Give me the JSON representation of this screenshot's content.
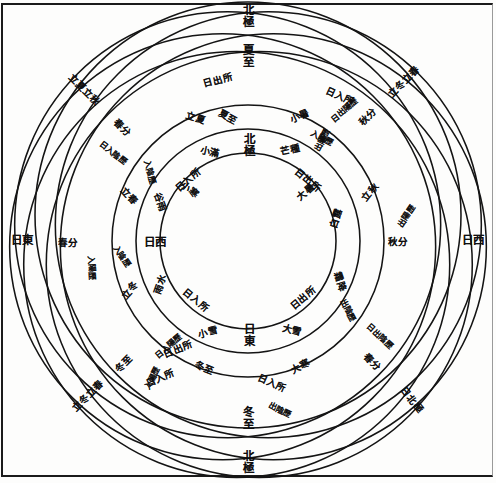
{
  "document": {
    "title": "七衡六間圖",
    "kind": "classical-chinese-astronomical-diagram"
  },
  "colors": {
    "ink": "#141414",
    "paper": "#fdfdfc",
    "frame": "#1b1b1b"
  },
  "chart_data": {
    "type": "diagram",
    "center": {
      "x": 248,
      "y": 241
    },
    "rings": [
      {
        "index": 1,
        "name": "內衡",
        "radius": 88,
        "cx": 248,
        "cy": 241
      },
      {
        "index": 2,
        "name": "二衡",
        "radius": 112,
        "cx": 248,
        "cy": 241
      },
      {
        "index": 3,
        "name": "三衡",
        "radius": 136,
        "cx": 248,
        "cy": 241
      },
      {
        "index": 4,
        "name": "中衡",
        "radius": 160,
        "cx": 248,
        "cy": 241
      },
      {
        "index": 5,
        "name": "五衡",
        "radius": 184,
        "cx": 248,
        "cy": 241
      },
      {
        "index": 6,
        "name": "六衡",
        "radius": 207,
        "cx": 248,
        "cy": 241
      },
      {
        "index": 7,
        "name": "外衡",
        "radius": 213,
        "cx": 248,
        "cy": 241
      }
    ],
    "offset_family": {
      "count": 7,
      "note": "each heng circle is drawn offset from the plate centre so the family interlaces",
      "offset_radius": 26,
      "start_angle_deg": -90
    }
  },
  "labels": {
    "cardinal": [
      {
        "id": "top-outer",
        "text": "北極",
        "x": 247,
        "y": 16,
        "size": "sz-md",
        "rot": 0,
        "orient": "vert"
      },
      {
        "id": "top-inner",
        "text": "夏至",
        "x": 247,
        "y": 56,
        "size": "sz-md",
        "rot": 0,
        "orient": "vert"
      },
      {
        "id": "bottom-inner",
        "text": "冬至",
        "x": 247,
        "y": 418,
        "size": "sz-md",
        "rot": 0,
        "orient": "vert"
      },
      {
        "id": "bottom-outer",
        "text": "北極",
        "x": 247,
        "y": 462,
        "size": "sz-md",
        "rot": 0,
        "orient": "vert"
      },
      {
        "id": "left-outer",
        "text": "日東",
        "x": 22,
        "y": 241,
        "size": "sz-md",
        "rot": 0,
        "orient": "horiz"
      },
      {
        "id": "right-outer",
        "text": "日西",
        "x": 473,
        "y": 241,
        "size": "sz-md",
        "rot": 0,
        "orient": "horiz"
      }
    ],
    "inner_ring": [
      {
        "id": "in-top",
        "text": "北極",
        "x": 248,
        "y": 145,
        "size": "sz-md",
        "rot": 0,
        "orient": "vert"
      },
      {
        "id": "in-left",
        "text": "日西",
        "x": 155,
        "y": 243,
        "size": "sz-md",
        "rot": 0,
        "orient": "horiz"
      },
      {
        "id": "in-bottom",
        "text": "日東",
        "x": 248,
        "y": 335,
        "size": "sz-md",
        "rot": 0,
        "orient": "vert"
      },
      {
        "id": "in-ul",
        "text": "日入所",
        "x": 188,
        "y": 180,
        "size": "sz-sm",
        "rot": -40,
        "orient": "horiz"
      },
      {
        "id": "in-ur",
        "text": "日出所",
        "x": 308,
        "y": 180,
        "size": "sz-sm",
        "rot": 40,
        "orient": "horiz"
      },
      {
        "id": "in-ll",
        "text": "日入所",
        "x": 196,
        "y": 300,
        "size": "sz-sm",
        "rot": 40,
        "orient": "horiz"
      },
      {
        "id": "in-lr",
        "text": "日出所",
        "x": 303,
        "y": 298,
        "size": "sz-sm",
        "rot": -40,
        "orient": "horiz"
      }
    ],
    "solar_terms": [
      {
        "id": "st-ul-1",
        "text": "立夏立秋",
        "x": 84,
        "y": 90,
        "size": "sz-sm",
        "rot": 45,
        "orient": "horiz"
      },
      {
        "id": "st-ul-2",
        "text": "春分",
        "x": 122,
        "y": 128,
        "size": "sz-sm",
        "rot": 45,
        "orient": "horiz"
      },
      {
        "id": "st-ul-3",
        "text": "日入陰歷",
        "x": 113,
        "y": 153,
        "size": "sz-xs",
        "rot": 38,
        "orient": "horiz"
      },
      {
        "id": "st-ul-4",
        "text": "入陰歷",
        "x": 150,
        "y": 172,
        "size": "sz-xs",
        "rot": 72,
        "orient": "horiz"
      },
      {
        "id": "st-ul-5",
        "text": "立春",
        "x": 129,
        "y": 196,
        "size": "sz-sm",
        "rot": 48,
        "orient": "horiz"
      },
      {
        "id": "st-ur-1",
        "text": "立冬立春",
        "x": 404,
        "y": 82,
        "size": "sz-sm",
        "rot": -45,
        "orient": "horiz"
      },
      {
        "id": "st-ur-2",
        "text": "秋分",
        "x": 368,
        "y": 117,
        "size": "sz-sm",
        "rot": -45,
        "orient": "horiz"
      },
      {
        "id": "st-ur-3",
        "text": "日出陽歷",
        "x": 344,
        "y": 110,
        "size": "sz-xs",
        "rot": -40,
        "orient": "horiz"
      },
      {
        "id": "st-ur-4",
        "text": "出陽歷",
        "x": 322,
        "y": 140,
        "size": "sz-xs",
        "rot": -62,
        "orient": "horiz"
      },
      {
        "id": "st-ur-5",
        "text": "立秋",
        "x": 370,
        "y": 192,
        "size": "sz-sm",
        "rot": -52,
        "orient": "horiz"
      },
      {
        "id": "st-ll-1",
        "text": "立冬立春",
        "x": 88,
        "y": 396,
        "size": "sz-sm",
        "rot": -45,
        "orient": "horiz"
      },
      {
        "id": "st-ll-2",
        "text": "冬至",
        "x": 124,
        "y": 364,
        "size": "sz-sm",
        "rot": -45,
        "orient": "horiz"
      },
      {
        "id": "st-ll-3",
        "text": "入陽歷",
        "x": 152,
        "y": 378,
        "size": "sz-xs",
        "rot": -62,
        "orient": "horiz"
      },
      {
        "id": "st-ll-4",
        "text": "日入陽歷",
        "x": 168,
        "y": 346,
        "size": "sz-xs",
        "rot": -40,
        "orient": "horiz"
      },
      {
        "id": "st-ll-5",
        "text": "立冬",
        "x": 130,
        "y": 290,
        "size": "sz-sm",
        "rot": -48,
        "orient": "horiz"
      },
      {
        "id": "st-lr-1",
        "text": "日北極",
        "x": 412,
        "y": 400,
        "size": "sz-sm",
        "rot": 52,
        "orient": "horiz"
      },
      {
        "id": "st-lr-2",
        "text": "春分",
        "x": 372,
        "y": 362,
        "size": "sz-sm",
        "rot": 48,
        "orient": "horiz"
      },
      {
        "id": "st-lr-3",
        "text": "日出陰歷",
        "x": 380,
        "y": 336,
        "size": "sz-xs",
        "rot": 42,
        "orient": "horiz"
      },
      {
        "id": "st-lr-4",
        "text": "出陰歷",
        "x": 348,
        "y": 310,
        "size": "sz-xs",
        "rot": 62,
        "orient": "horiz"
      },
      {
        "id": "st-lr-5",
        "text": "秋分",
        "x": 398,
        "y": 242,
        "size": "sz-sm",
        "rot": 0,
        "orient": "horiz"
      },
      {
        "id": "st-l-1",
        "text": "春分",
        "x": 68,
        "y": 243,
        "size": "sz-sm",
        "rot": 0,
        "orient": "horiz"
      },
      {
        "id": "st-l-2",
        "text": "入陽歷",
        "x": 92,
        "y": 268,
        "size": "sz-xs",
        "rot": 86,
        "orient": "horiz"
      },
      {
        "id": "st-l-3",
        "text": "入陰歷",
        "x": 122,
        "y": 256,
        "size": "sz-xs",
        "rot": 56,
        "orient": "horiz"
      },
      {
        "id": "st-r-1",
        "text": "出陽歷",
        "x": 406,
        "y": 216,
        "size": "sz-xs",
        "rot": -56,
        "orient": "horiz"
      },
      {
        "id": "st-t-1",
        "text": "日出所",
        "x": 218,
        "y": 80,
        "size": "sz-sm",
        "rot": -16,
        "orient": "horiz"
      },
      {
        "id": "st-t-2",
        "text": "日入所",
        "x": 340,
        "y": 96,
        "size": "sz-sm",
        "rot": 25,
        "orient": "horiz"
      },
      {
        "id": "st-t-3",
        "text": "立夏",
        "x": 196,
        "y": 118,
        "size": "sz-sm",
        "rot": 18,
        "orient": "horiz"
      },
      {
        "id": "st-t-4",
        "text": "夏至",
        "x": 228,
        "y": 117,
        "size": "sz-sm",
        "rot": 28,
        "orient": "horiz"
      },
      {
        "id": "st-t-5",
        "text": "小暑",
        "x": 300,
        "y": 116,
        "size": "sz-sm",
        "rot": -24,
        "orient": "horiz"
      },
      {
        "id": "st-t-6",
        "text": "入陰歷",
        "x": 322,
        "y": 138,
        "size": "sz-xs",
        "rot": 28,
        "orient": "horiz"
      },
      {
        "id": "st-b-1",
        "text": "日入所",
        "x": 272,
        "y": 383,
        "size": "sz-sm",
        "rot": 24,
        "orient": "horiz"
      },
      {
        "id": "st-b-2",
        "text": "日出所",
        "x": 178,
        "y": 349,
        "size": "sz-sm",
        "rot": -22,
        "orient": "horiz"
      },
      {
        "id": "st-b-3",
        "text": "日入所",
        "x": 160,
        "y": 378,
        "size": "sz-sm",
        "rot": -24,
        "orient": "horiz"
      },
      {
        "id": "st-b-4",
        "text": "冬至",
        "x": 204,
        "y": 368,
        "size": "sz-sm",
        "rot": 22,
        "orient": "horiz"
      },
      {
        "id": "st-b-5",
        "text": "大寒",
        "x": 300,
        "y": 366,
        "size": "sz-sm",
        "rot": -28,
        "orient": "horiz"
      },
      {
        "id": "st-b-6",
        "text": "出陰歷",
        "x": 280,
        "y": 410,
        "size": "sz-xs",
        "rot": 26,
        "orient": "horiz"
      },
      {
        "id": "st-m-1",
        "text": "小寒",
        "x": 190,
        "y": 190,
        "size": "sz-sm",
        "rot": 40,
        "orient": "horiz"
      },
      {
        "id": "st-m-2",
        "text": "大暑",
        "x": 306,
        "y": 192,
        "size": "sz-sm",
        "rot": -40,
        "orient": "horiz"
      },
      {
        "id": "st-m-3",
        "text": "白露",
        "x": 336,
        "y": 218,
        "size": "sz-sm",
        "rot": -72,
        "orient": "horiz"
      },
      {
        "id": "st-m-4",
        "text": "霜降",
        "x": 340,
        "y": 282,
        "size": "sz-sm",
        "rot": 72,
        "orient": "horiz"
      },
      {
        "id": "st-m-5",
        "text": "雨水",
        "x": 160,
        "y": 284,
        "size": "sz-sm",
        "rot": -70,
        "orient": "horiz"
      },
      {
        "id": "st-m-6",
        "text": "谷雨",
        "x": 160,
        "y": 202,
        "size": "sz-sm",
        "rot": 70,
        "orient": "horiz"
      },
      {
        "id": "st-m-7",
        "text": "小滿",
        "x": 210,
        "y": 152,
        "size": "sz-sm",
        "rot": 12,
        "orient": "horiz"
      },
      {
        "id": "st-m-8",
        "text": "芒種",
        "x": 290,
        "y": 150,
        "size": "sz-sm",
        "rot": -12,
        "orient": "horiz"
      },
      {
        "id": "st-m-9",
        "text": "小雪",
        "x": 208,
        "y": 332,
        "size": "sz-sm",
        "rot": -14,
        "orient": "horiz"
      },
      {
        "id": "st-m-10",
        "text": "大雪",
        "x": 292,
        "y": 330,
        "size": "sz-sm",
        "rot": 14,
        "orient": "horiz"
      }
    ]
  }
}
